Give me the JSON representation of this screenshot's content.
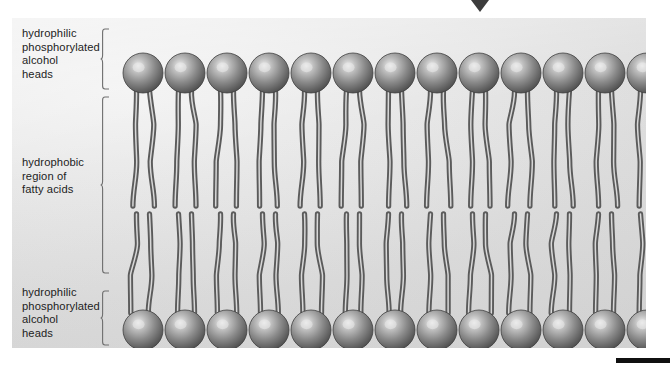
{
  "figure": {
    "type": "diagram",
    "panel": {
      "background_color": "#e4e4e4",
      "left": 12,
      "top": 18,
      "width": 634,
      "height": 330
    },
    "marker": {
      "name": "down-pointer-triangle",
      "color": "#3c3c3c",
      "x": 480,
      "y": 0
    },
    "bottom_rule": {
      "color": "#101010"
    }
  },
  "labels": {
    "top": "hydrophilic\nphosphorylated\nalcohol\nheads",
    "middle": "hydrophobic\nregion of\nfatty acids",
    "bottom": "hydrophilic\nphosphorylated\nalcohol\nheads"
  },
  "brackets": [
    {
      "name": "bracket-hydrophilic-top",
      "top": 10,
      "height": 62
    },
    {
      "name": "bracket-hydrophobic-middle",
      "top": 78,
      "height": 178
    },
    {
      "name": "bracket-hydrophilic-bottom",
      "top": 272,
      "height": 56
    }
  ],
  "bilayer": {
    "head_count_per_row": 13,
    "rows": [
      "upper",
      "lower"
    ],
    "head": {
      "radius": 20,
      "fill_dark": "#5a5a5a",
      "fill_mid": "#8d8d8d",
      "highlight": "#e9e9e9",
      "outline": "#3f3f3f"
    },
    "tail": {
      "tails_per_lipid": 2,
      "color": "#5b5b5b",
      "inner_color": "#d8d8d8",
      "width": 3.2
    },
    "geometry": {
      "first_head_center_x": 131,
      "head_spacing_x": 42,
      "upper_head_center_y": 55,
      "lower_head_center_y": 312,
      "upper_tail_end_y": 188,
      "lower_tail_start_y": 196
    },
    "colors": {
      "accent_dark": "#3c3c3c",
      "panel_gray": "#e4e4e4"
    }
  }
}
